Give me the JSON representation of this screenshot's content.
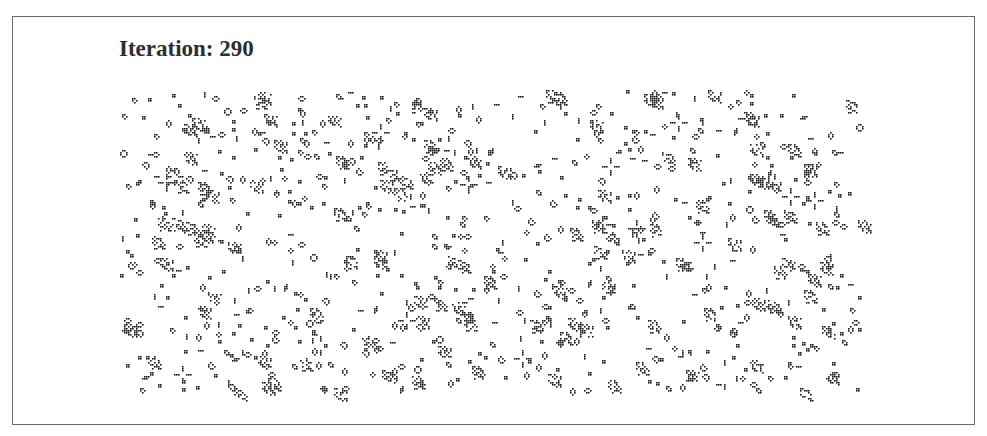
{
  "title": {
    "label": "Iteration:",
    "iteration": "290",
    "text": "Iteration: 290"
  },
  "grid": {
    "origin_px": [
      120,
      90
    ],
    "cell_px": 2,
    "cols": 380,
    "rows": 160,
    "live_color": "#1a1a1a",
    "dead_color": "#ffffff",
    "pattern_library": {
      "block": [
        [
          0,
          0
        ],
        [
          1,
          0
        ],
        [
          0,
          1
        ],
        [
          1,
          1
        ]
      ],
      "beehive": [
        [
          1,
          0
        ],
        [
          2,
          0
        ],
        [
          0,
          1
        ],
        [
          3,
          1
        ],
        [
          1,
          2
        ],
        [
          2,
          2
        ]
      ],
      "loaf": [
        [
          1,
          0
        ],
        [
          2,
          0
        ],
        [
          0,
          1
        ],
        [
          3,
          1
        ],
        [
          1,
          2
        ],
        [
          3,
          2
        ],
        [
          2,
          3
        ]
      ],
      "boat": [
        [
          0,
          0
        ],
        [
          1,
          0
        ],
        [
          0,
          1
        ],
        [
          2,
          1
        ],
        [
          1,
          2
        ]
      ],
      "tub": [
        [
          1,
          0
        ],
        [
          0,
          1
        ],
        [
          2,
          1
        ],
        [
          1,
          2
        ]
      ],
      "blinker_h": [
        [
          0,
          0
        ],
        [
          1,
          0
        ],
        [
          2,
          0
        ]
      ],
      "blinker_v": [
        [
          0,
          0
        ],
        [
          0,
          1
        ],
        [
          0,
          2
        ]
      ],
      "pond": [
        [
          1,
          0
        ],
        [
          2,
          0
        ],
        [
          0,
          1
        ],
        [
          3,
          1
        ],
        [
          0,
          2
        ],
        [
          3,
          2
        ],
        [
          1,
          3
        ],
        [
          2,
          3
        ]
      ],
      "traffic_light": [
        [
          4,
          0
        ],
        [
          4,
          1
        ],
        [
          4,
          2
        ],
        [
          0,
          4
        ],
        [
          1,
          4
        ],
        [
          2,
          4
        ],
        [
          6,
          4
        ],
        [
          7,
          4
        ],
        [
          8,
          4
        ],
        [
          4,
          6
        ],
        [
          4,
          7
        ],
        [
          4,
          8
        ]
      ],
      "ship": [
        [
          0,
          0
        ],
        [
          1,
          0
        ],
        [
          0,
          1
        ],
        [
          2,
          1
        ],
        [
          1,
          2
        ],
        [
          2,
          2
        ]
      ],
      "toad": [
        [
          1,
          0
        ],
        [
          2,
          0
        ],
        [
          3,
          0
        ],
        [
          0,
          1
        ],
        [
          1,
          1
        ],
        [
          2,
          1
        ]
      ],
      "cluster": [
        [
          0,
          0
        ],
        [
          1,
          0
        ],
        [
          3,
          0
        ],
        [
          0,
          1
        ],
        [
          2,
          1
        ],
        [
          3,
          1
        ],
        [
          4,
          1
        ],
        [
          1,
          2
        ],
        [
          4,
          2
        ],
        [
          5,
          2
        ],
        [
          0,
          3
        ],
        [
          2,
          3
        ],
        [
          3,
          3
        ],
        [
          5,
          3
        ],
        [
          1,
          4
        ],
        [
          2,
          4
        ],
        [
          4,
          4
        ],
        [
          6,
          4
        ],
        [
          3,
          5
        ],
        [
          4,
          5
        ],
        [
          5,
          5
        ],
        [
          1,
          6
        ],
        [
          2,
          6
        ],
        [
          5,
          6
        ],
        [
          6,
          6
        ]
      ]
    },
    "seed": 290,
    "placement_counts": {
      "block": 260,
      "beehive": 120,
      "loaf": 40,
      "boat": 45,
      "tub": 30,
      "blinker_h": 70,
      "blinker_v": 70,
      "pond": 10,
      "traffic_light": 14,
      "ship": 30,
      "toad": 15,
      "cluster": 120
    }
  }
}
